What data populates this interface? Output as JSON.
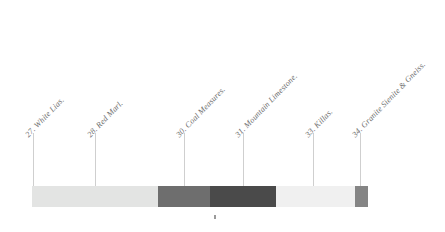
{
  "diagram": {
    "type": "stratigraphic-color-bar",
    "labels": [
      {
        "text": "27. White Lias.",
        "x": 30,
        "y": 131,
        "leader_x": 33,
        "leader_top": 133,
        "leader_bottom": 186
      },
      {
        "text": "28. Red Marl.",
        "x": 92,
        "y": 131,
        "leader_x": 95,
        "leader_top": 133,
        "leader_bottom": 186
      },
      {
        "text": "30. Coal Measures.",
        "x": 181,
        "y": 131,
        "leader_x": 184,
        "leader_top": 133,
        "leader_bottom": 186
      },
      {
        "text": "31. Mountain Limestone.",
        "x": 240,
        "y": 131,
        "leader_x": 243,
        "leader_top": 133,
        "leader_bottom": 186
      },
      {
        "text": "33. Killas.",
        "x": 310,
        "y": 131,
        "leader_x": 313,
        "leader_top": 133,
        "leader_bottom": 186
      },
      {
        "text": "34. Granite Sienite & Gneiss.",
        "x": 357,
        "y": 131,
        "leader_x": 360,
        "leader_top": 133,
        "leader_bottom": 186
      }
    ],
    "bar": {
      "x": 32,
      "y": 186,
      "width": 336,
      "height": 21,
      "segments": [
        {
          "name": "white-lias",
          "color": "#e3e4e3",
          "width": 126
        },
        {
          "name": "coal-measures",
          "color": "#6e6e6e",
          "width": 52
        },
        {
          "name": "mountain-limestone",
          "color": "#4a4a4a",
          "width": 66
        },
        {
          "name": "killas",
          "color": "#f0f0f0",
          "width": 79
        },
        {
          "name": "granite-sienite-gneiss",
          "color": "#858585",
          "width": 13
        }
      ]
    },
    "under_tick": {
      "x": 214,
      "y": 215
    },
    "colors": {
      "leader_line": "#cfcfcf",
      "label_text": "#6d6d6d",
      "background": "#ffffff"
    }
  }
}
